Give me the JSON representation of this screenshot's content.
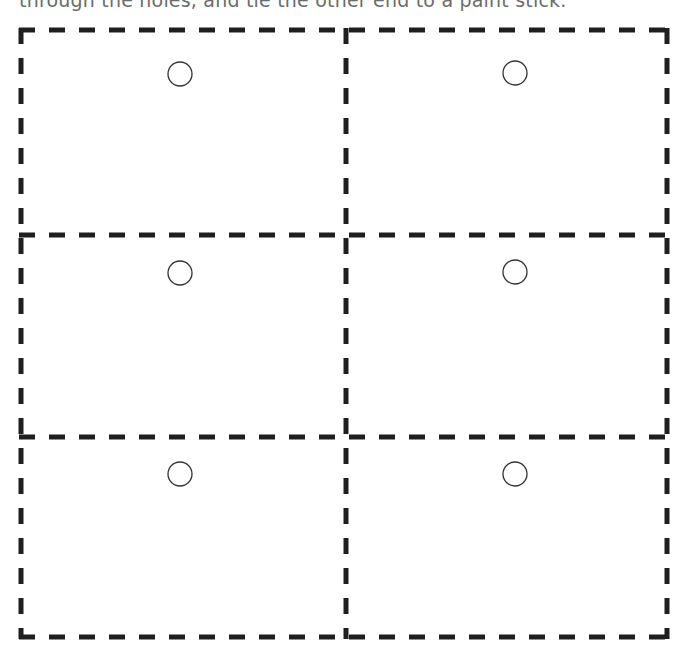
{
  "caption": "through the holes, and tie the other end to a paint stick.",
  "template": {
    "stroke_color": "#1f1f1f",
    "circle_color": "#333333",
    "dash_length": 16,
    "dash_gap": 14,
    "line_width": 5,
    "grid": {
      "columns": 2,
      "rows": 3,
      "x_lines": [
        21,
        346,
        667
      ],
      "y_lines": [
        30,
        235,
        437,
        637
      ]
    },
    "cards": [
      {
        "name": "card-1",
        "row": 0,
        "col": 0,
        "hole": {
          "cx": 180,
          "cy": 74,
          "r": 12
        }
      },
      {
        "name": "card-2",
        "row": 0,
        "col": 1,
        "hole": {
          "cx": 515,
          "cy": 73,
          "r": 12
        }
      },
      {
        "name": "card-3",
        "row": 1,
        "col": 0,
        "hole": {
          "cx": 180,
          "cy": 273,
          "r": 12
        }
      },
      {
        "name": "card-4",
        "row": 1,
        "col": 1,
        "hole": {
          "cx": 515,
          "cy": 272,
          "r": 12
        }
      },
      {
        "name": "card-5",
        "row": 2,
        "col": 0,
        "hole": {
          "cx": 180,
          "cy": 474,
          "r": 12
        }
      },
      {
        "name": "card-6",
        "row": 2,
        "col": 1,
        "hole": {
          "cx": 515,
          "cy": 474,
          "r": 12
        }
      }
    ]
  }
}
